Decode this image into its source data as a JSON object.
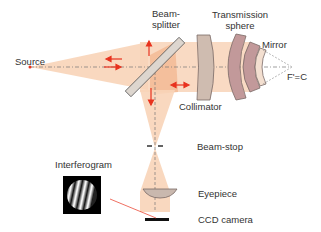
{
  "diagram": {
    "labels": {
      "source": "Source",
      "beam_splitter_line1": "Beam-",
      "beam_splitter_line2": "splitter",
      "transmission_sphere_line1": "Transmission",
      "transmission_sphere_line2": "sphere",
      "mirror": "Mirror",
      "focus": "F'=C",
      "collimator": "Collimator",
      "beam_stop": "Beam-stop",
      "interferogram": "Interferogram",
      "eyepiece": "Eyepiece",
      "ccd_camera": "CCD camera"
    },
    "colors": {
      "beam": "#f6c9a8",
      "beam_dark": "#f0a878",
      "arrow": "#e8321e",
      "lens_fill": "#c9a89f",
      "lens_stroke": "#7a6a66",
      "collimator_fill": "#cfbcb0",
      "axis": "#777777",
      "text": "#333333"
    },
    "components": [
      "source",
      "beam-splitter",
      "collimator",
      "transmission-sphere",
      "mirror",
      "beam-stop",
      "eyepiece",
      "ccd-camera",
      "interferogram"
    ]
  }
}
